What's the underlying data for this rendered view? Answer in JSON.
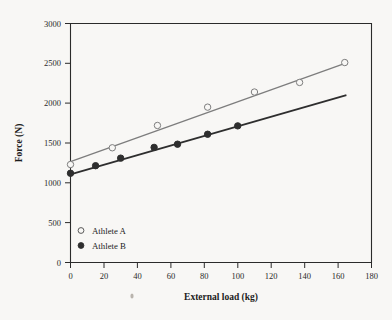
{
  "figure": {
    "background_color": "#f8f7f5",
    "frame_color": "#2b2b2b"
  },
  "chart_data": {
    "type": "scatter",
    "title": "",
    "xlabel": "External load (kg)",
    "ylabel": "Force (N)",
    "xlim": [
      0,
      180
    ],
    "ylim": [
      0,
      3000
    ],
    "xticks": [
      0,
      20,
      40,
      60,
      80,
      100,
      120,
      140,
      160,
      180
    ],
    "yticks": [
      0,
      500,
      1000,
      1500,
      2000,
      2500,
      3000
    ],
    "grid": false,
    "legend_position": "bottom-left",
    "series": [
      {
        "name": "Athlete A",
        "marker": "open-circle",
        "color": "#7d7d7d",
        "line_color": "#7d7d7d",
        "points": [
          {
            "x": 0,
            "y": 1230
          },
          {
            "x": 25,
            "y": 1440
          },
          {
            "x": 52,
            "y": 1720
          },
          {
            "x": 82,
            "y": 1950
          },
          {
            "x": 110,
            "y": 2140
          },
          {
            "x": 137,
            "y": 2260
          },
          {
            "x": 164,
            "y": 2510
          }
        ],
        "fit_line": {
          "x0": 0,
          "y0": 1265,
          "x1": 165,
          "y1": 2505
        }
      },
      {
        "name": "Athlete B",
        "marker": "filled-circle",
        "color": "#2e2e2e",
        "line_color": "#2e2e2e",
        "points": [
          {
            "x": 0,
            "y": 1120
          },
          {
            "x": 15,
            "y": 1215
          },
          {
            "x": 30,
            "y": 1310
          },
          {
            "x": 50,
            "y": 1445
          },
          {
            "x": 64,
            "y": 1485
          },
          {
            "x": 82,
            "y": 1610
          },
          {
            "x": 100,
            "y": 1715
          }
        ],
        "fit_line": {
          "x0": 0,
          "y0": 1105,
          "x1": 165,
          "y1": 2100
        }
      }
    ]
  },
  "legend": {
    "items": [
      {
        "label": "Athlete A",
        "marker": "open-circle"
      },
      {
        "label": "Athlete B",
        "marker": "filled-circle"
      }
    ]
  },
  "tick_labels": {
    "x": [
      "0",
      "20",
      "40",
      "60",
      "80",
      "100",
      "120",
      "140",
      "160",
      "180"
    ],
    "y": [
      "0",
      "500",
      "1000",
      "1500",
      "2000",
      "2500",
      "3000"
    ]
  }
}
